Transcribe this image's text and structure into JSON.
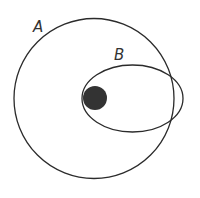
{
  "labels": {
    "orbit_a": "A",
    "orbit_b": "B"
  },
  "colors": {
    "stroke": "#2b2b2b",
    "central_body": "#333333",
    "background": "#ffffff"
  }
}
